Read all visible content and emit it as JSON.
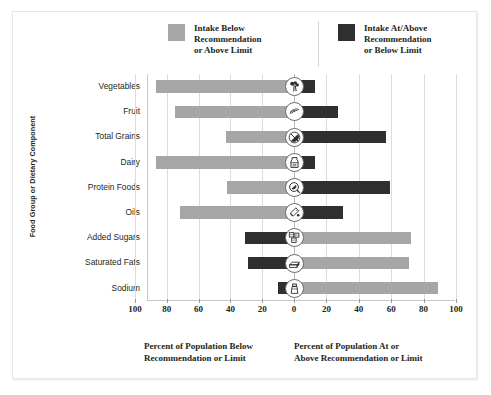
{
  "legend": {
    "items": [
      {
        "label": "Intake Below\nRecommendation\nor Above Limit",
        "color": "#a6a6a6",
        "swatch_name": "gray"
      },
      {
        "label": "Intake At/Above\nRecommendation\nor Below Limit",
        "color": "#2f2f2f",
        "swatch_name": "dark"
      }
    ]
  },
  "axis": {
    "ylabel": "Food Group or Dietary Component",
    "xlabel_left": "Percent of Population Below\nRecommendation or Limit",
    "xlabel_right": "Percent of Population At or\nAbove Recommendation or Limit",
    "ticks": [
      "100",
      "80",
      "60",
      "40",
      "20",
      "0",
      "20",
      "40",
      "60",
      "80",
      "100"
    ]
  },
  "chart_data": {
    "type": "bar",
    "orientation": "horizontal",
    "subtype": "diverging-bar",
    "title": "",
    "xlabel_left": "Percent of Population Below Recommendation or Limit",
    "xlabel_right": "Percent of Population At or Above Recommendation or Limit",
    "ylabel": "Food Group or Dietary Component",
    "xlim": [
      -100,
      100
    ],
    "xticks": [
      -100,
      -80,
      -60,
      -40,
      -20,
      0,
      20,
      40,
      60,
      80,
      100
    ],
    "xtick_labels": [
      "100",
      "80",
      "60",
      "40",
      "20",
      "0",
      "20",
      "40",
      "60",
      "80",
      "100"
    ],
    "grid": true,
    "legend_position": "top",
    "categories": [
      "Vegetables",
      "Fruit",
      "Total Grains",
      "Dairy",
      "Protein Foods",
      "Oils",
      "Added Sugars",
      "Saturated Fats",
      "Sodium"
    ],
    "series": [
      {
        "name": "Intake Below Recommendation or Above Limit",
        "color": "#a6a6a6",
        "side": "varies",
        "values": [
          87,
          75,
          43,
          87,
          42,
          72,
          72,
          71,
          89
        ]
      },
      {
        "name": "Intake At/Above Recommendation or Below Limit",
        "color": "#2f2f2f",
        "side": "varies",
        "values": [
          13,
          27,
          57,
          13,
          59,
          30,
          31,
          29,
          10
        ]
      }
    ],
    "rows": [
      {
        "category": "Vegetables",
        "icon": "broccoli-icon",
        "gray_side": "left",
        "gray_value": 87,
        "dark_side": "right",
        "dark_value": 13
      },
      {
        "category": "Fruit",
        "icon": "fruit-slice-icon",
        "gray_side": "left",
        "gray_value": 75,
        "dark_side": "right",
        "dark_value": 27
      },
      {
        "category": "Total Grains",
        "icon": "grains-icon",
        "gray_side": "left",
        "gray_value": 43,
        "dark_side": "right",
        "dark_value": 57
      },
      {
        "category": "Dairy",
        "icon": "dairy-icon",
        "gray_side": "left",
        "gray_value": 87,
        "dark_side": "right",
        "dark_value": 13
      },
      {
        "category": "Protein Foods",
        "icon": "protein-icon",
        "gray_side": "left",
        "gray_value": 42,
        "dark_side": "right",
        "dark_value": 59
      },
      {
        "category": "Oils",
        "icon": "oils-icon",
        "gray_side": "left",
        "gray_value": 72,
        "dark_side": "right",
        "dark_value": 30
      },
      {
        "category": "Added Sugars",
        "icon": "sugar-icon",
        "gray_side": "right",
        "gray_value": 72,
        "dark_side": "left",
        "dark_value": 31
      },
      {
        "category": "Saturated Fats",
        "icon": "butter-icon",
        "gray_side": "right",
        "gray_value": 71,
        "dark_side": "left",
        "dark_value": 29
      },
      {
        "category": "Sodium",
        "icon": "salt-icon",
        "gray_side": "right",
        "gray_value": 89,
        "dark_side": "left",
        "dark_value": 10
      }
    ]
  },
  "colors": {
    "gray_bar": "#a6a6a6",
    "dark_bar": "#2f2f2f",
    "text": "#231f20",
    "grid": "#dcdcdc",
    "frame": "#e6e6e6"
  }
}
